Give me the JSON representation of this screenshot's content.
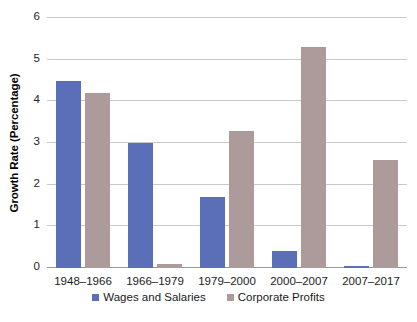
{
  "chart_data": {
    "type": "bar",
    "title": "",
    "xlabel": "",
    "ylabel": "Growth Rate (Percentage)",
    "categories": [
      "1948–1966",
      "1966–1979",
      "1979–2000",
      "2000–2007",
      "2007–2017"
    ],
    "series": [
      {
        "name": "Wages and Salaries",
        "color": "#5b6fb8",
        "values": [
          4.5,
          3.0,
          1.7,
          0.4,
          0.05
        ]
      },
      {
        "name": "Corporate Profits",
        "color": "#ad9a9a",
        "values": [
          4.2,
          0.1,
          3.3,
          5.3,
          2.6
        ]
      }
    ],
    "ylim": [
      0,
      6
    ],
    "yticks": [
      0,
      1,
      2,
      3,
      4,
      5,
      6
    ],
    "ytick_labels": [
      "0",
      "1",
      "2",
      "3",
      "4",
      "5",
      "6"
    ],
    "grid": true,
    "legend_position": "bottom",
    "gridline_color": "#c9c9c9",
    "baseline_color": "#9a9a9a",
    "background": "#ffffff"
  }
}
